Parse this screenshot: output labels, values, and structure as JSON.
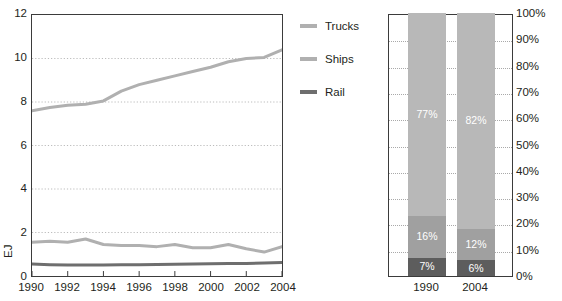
{
  "chart_data": [
    {
      "type": "line",
      "title": "",
      "xlabel": "",
      "ylabel": "EJ",
      "xlim": [
        1990,
        2004
      ],
      "ylim": [
        0,
        12
      ],
      "grid": true,
      "grid_axis": "y",
      "legend_position": "right",
      "x": [
        1990,
        1991,
        1992,
        1993,
        1994,
        1995,
        1996,
        1997,
        1998,
        1999,
        2000,
        2001,
        2002,
        2003,
        2004
      ],
      "xticks": [
        "1990",
        "1992",
        "1994",
        "1996",
        "1998",
        "2000",
        "2002",
        "2004"
      ],
      "yticks": [
        "0",
        "2",
        "4",
        "6",
        "8",
        "10",
        "12"
      ],
      "series": [
        {
          "name": "Trucks",
          "color": "#b0b0b0",
          "values": [
            7.6,
            7.75,
            7.85,
            7.9,
            8.05,
            8.5,
            8.8,
            9.0,
            9.2,
            9.4,
            9.6,
            9.85,
            10.0,
            10.05,
            10.4
          ]
        },
        {
          "name": "Ships",
          "color": "#b0b0b0",
          "values": [
            1.55,
            1.6,
            1.55,
            1.7,
            1.45,
            1.4,
            1.4,
            1.35,
            1.45,
            1.3,
            1.3,
            1.45,
            1.25,
            1.1,
            1.35
          ]
        },
        {
          "name": "Rail",
          "color": "#6e6e6e",
          "values": [
            0.55,
            0.52,
            0.5,
            0.5,
            0.5,
            0.52,
            0.52,
            0.53,
            0.54,
            0.55,
            0.56,
            0.57,
            0.58,
            0.6,
            0.62
          ]
        }
      ]
    },
    {
      "type": "bar",
      "subtype": "stacked-100",
      "title": "",
      "xlabel": "",
      "ylabel": "",
      "ylim": [
        0,
        100
      ],
      "grid": true,
      "categories": [
        "1990",
        "2004"
      ],
      "yticks": [
        "0%",
        "10%",
        "20%",
        "30%",
        "40%",
        "50%",
        "60%",
        "70%",
        "80%",
        "90%",
        "100%"
      ],
      "series": [
        {
          "name": "Rail",
          "color": "#5d5d5d",
          "values": [
            7,
            6
          ],
          "labels": [
            "7%",
            "6%"
          ]
        },
        {
          "name": "Ships",
          "color": "#a0a0a0",
          "values": [
            16,
            12
          ],
          "labels": [
            "16%",
            "12%"
          ]
        },
        {
          "name": "Trucks",
          "color": "#b8b8b8",
          "values": [
            77,
            82
          ],
          "labels": [
            "77%",
            "82%"
          ]
        }
      ]
    }
  ],
  "line_chart": {
    "y_axis_unit": "EJ",
    "y_ticks": [
      {
        "label": "12",
        "value": 12
      },
      {
        "label": "10",
        "value": 10
      },
      {
        "label": "8",
        "value": 8
      },
      {
        "label": "6",
        "value": 6
      },
      {
        "label": "4",
        "value": 4
      },
      {
        "label": "2",
        "value": 2
      },
      {
        "label": "0",
        "value": 0
      }
    ],
    "x_ticks": [
      {
        "label": "1990",
        "value": 1990
      },
      {
        "label": "1992",
        "value": 1992
      },
      {
        "label": "1994",
        "value": 1994
      },
      {
        "label": "1996",
        "value": 1996
      },
      {
        "label": "1998",
        "value": 1998
      },
      {
        "label": "2000",
        "value": 2000
      },
      {
        "label": "2002",
        "value": 2002
      },
      {
        "label": "2004",
        "value": 2004
      }
    ]
  },
  "legend": {
    "items": [
      {
        "label": "Trucks",
        "color": "#b0b0b0"
      },
      {
        "label": "Ships",
        "color": "#b0b0b0"
      },
      {
        "label": "Rail",
        "color": "#6e6e6e"
      }
    ]
  },
  "bar_chart": {
    "y_ticks": [
      {
        "label": "100%",
        "value": 100
      },
      {
        "label": "90%",
        "value": 90
      },
      {
        "label": "80%",
        "value": 80
      },
      {
        "label": "70%",
        "value": 70
      },
      {
        "label": "60%",
        "value": 60
      },
      {
        "label": "50%",
        "value": 50
      },
      {
        "label": "40%",
        "value": 40
      },
      {
        "label": "30%",
        "value": 30
      },
      {
        "label": "20%",
        "value": 20
      },
      {
        "label": "10%",
        "value": 10
      },
      {
        "label": "0%",
        "value": 0
      }
    ],
    "bars": [
      {
        "category": "1990",
        "segments": [
          {
            "name": "Rail",
            "value": 7,
            "label": "7%",
            "color": "#5d5d5d"
          },
          {
            "name": "Ships",
            "value": 16,
            "label": "16%",
            "color": "#a0a0a0"
          },
          {
            "name": "Trucks",
            "value": 77,
            "label": "77%",
            "color": "#b8b8b8"
          }
        ]
      },
      {
        "category": "2004",
        "segments": [
          {
            "name": "Rail",
            "value": 6,
            "label": "6%",
            "color": "#5d5d5d"
          },
          {
            "name": "Ships",
            "value": 12,
            "label": "12%",
            "color": "#a0a0a0"
          },
          {
            "name": "Trucks",
            "value": 82,
            "label": "82%",
            "color": "#b8b8b8"
          }
        ]
      }
    ]
  },
  "colors": {
    "trucks": "#b0b0b0",
    "ships": "#a0a0a0",
    "rail": "#5d5d5d",
    "axis": "#3b3b3b",
    "grid": "#a9a9a9",
    "text": "#231f20"
  }
}
